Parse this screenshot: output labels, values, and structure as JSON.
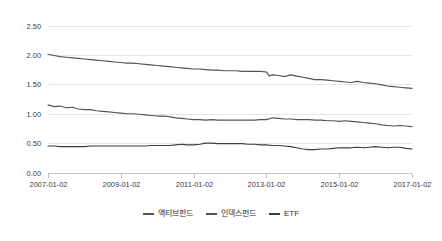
{
  "chart_data": {
    "type": "line",
    "title": "",
    "xlabel": "",
    "ylabel": "",
    "ylim": [
      0.0,
      2.5
    ],
    "ytick_labels": [
      "0.00",
      "0.50",
      "1.00",
      "1.50",
      "2.00",
      "2.50"
    ],
    "ytick_values": [
      0.0,
      0.5,
      1.0,
      1.5,
      2.0,
      2.5
    ],
    "xtick_labels": [
      "2007-01-02",
      "2009-01-02",
      "2011-01-02",
      "2013-01-02",
      "2015-01-02",
      "2017-01-02"
    ],
    "xtick_values": [
      2007.0,
      2009.0,
      2011.0,
      2013.0,
      2015.0,
      2017.0
    ],
    "xlim": [
      2007.0,
      2017.0
    ],
    "grid": "horizontal",
    "legend_position": "bottom-center",
    "series": [
      {
        "name": "액티브펀드",
        "color": "#545454",
        "x": [
          2007.0,
          2007.17,
          2007.33,
          2007.5,
          2007.67,
          2007.83,
          2008.0,
          2008.17,
          2008.33,
          2008.5,
          2008.67,
          2008.83,
          2009.0,
          2009.17,
          2009.33,
          2009.5,
          2009.67,
          2009.83,
          2010.0,
          2010.17,
          2010.33,
          2010.5,
          2010.67,
          2010.83,
          2011.0,
          2011.17,
          2011.33,
          2011.5,
          2011.67,
          2011.83,
          2012.0,
          2012.17,
          2012.33,
          2012.5,
          2012.67,
          2012.83,
          2013.0,
          2013.08,
          2013.17,
          2013.33,
          2013.5,
          2013.67,
          2013.83,
          2014.0,
          2014.17,
          2014.33,
          2014.5,
          2014.67,
          2014.83,
          2015.0,
          2015.17,
          2015.33,
          2015.5,
          2015.67,
          2015.83,
          2016.0,
          2016.17,
          2016.33,
          2016.5,
          2016.67,
          2016.83,
          2017.0
        ],
        "values": [
          2.01,
          1.99,
          1.97,
          1.96,
          1.95,
          1.94,
          1.93,
          1.92,
          1.91,
          1.9,
          1.89,
          1.88,
          1.87,
          1.86,
          1.86,
          1.85,
          1.84,
          1.83,
          1.82,
          1.81,
          1.8,
          1.79,
          1.78,
          1.77,
          1.76,
          1.76,
          1.75,
          1.74,
          1.74,
          1.73,
          1.73,
          1.73,
          1.72,
          1.72,
          1.72,
          1.72,
          1.71,
          1.64,
          1.66,
          1.65,
          1.63,
          1.66,
          1.64,
          1.62,
          1.6,
          1.58,
          1.58,
          1.57,
          1.56,
          1.55,
          1.54,
          1.53,
          1.55,
          1.53,
          1.52,
          1.51,
          1.49,
          1.47,
          1.46,
          1.45,
          1.44,
          1.43
        ]
      },
      {
        "name": "인덱스펀드",
        "color": "#545454",
        "x": [
          2007.0,
          2007.17,
          2007.33,
          2007.5,
          2007.67,
          2007.83,
          2008.0,
          2008.17,
          2008.33,
          2008.5,
          2008.67,
          2008.83,
          2009.0,
          2009.17,
          2009.33,
          2009.5,
          2009.67,
          2009.83,
          2010.0,
          2010.17,
          2010.33,
          2010.5,
          2010.67,
          2010.83,
          2011.0,
          2011.17,
          2011.33,
          2011.5,
          2011.67,
          2011.83,
          2012.0,
          2012.17,
          2012.33,
          2012.5,
          2012.67,
          2012.83,
          2013.0,
          2013.17,
          2013.33,
          2013.5,
          2013.67,
          2013.83,
          2014.0,
          2014.17,
          2014.33,
          2014.5,
          2014.67,
          2014.83,
          2015.0,
          2015.17,
          2015.33,
          2015.5,
          2015.67,
          2015.83,
          2016.0,
          2016.17,
          2016.33,
          2016.5,
          2016.67,
          2016.83,
          2017.0
        ],
        "values": [
          1.15,
          1.12,
          1.13,
          1.1,
          1.11,
          1.08,
          1.07,
          1.07,
          1.05,
          1.04,
          1.03,
          1.02,
          1.01,
          1.0,
          1.0,
          0.99,
          0.98,
          0.97,
          0.96,
          0.96,
          0.95,
          0.93,
          0.92,
          0.91,
          0.9,
          0.9,
          0.89,
          0.9,
          0.89,
          0.89,
          0.89,
          0.89,
          0.89,
          0.89,
          0.89,
          0.9,
          0.9,
          0.93,
          0.92,
          0.91,
          0.91,
          0.9,
          0.9,
          0.9,
          0.89,
          0.89,
          0.88,
          0.88,
          0.87,
          0.88,
          0.87,
          0.86,
          0.85,
          0.84,
          0.83,
          0.81,
          0.8,
          0.79,
          0.8,
          0.79,
          0.78
        ]
      },
      {
        "name": "ETF",
        "color": "#3d3d3d",
        "x": [
          2007.0,
          2007.17,
          2007.33,
          2007.5,
          2007.67,
          2007.83,
          2008.0,
          2008.17,
          2008.33,
          2008.5,
          2008.67,
          2008.83,
          2009.0,
          2009.17,
          2009.33,
          2009.5,
          2009.67,
          2009.83,
          2010.0,
          2010.17,
          2010.33,
          2010.5,
          2010.67,
          2010.83,
          2011.0,
          2011.17,
          2011.33,
          2011.5,
          2011.67,
          2011.83,
          2012.0,
          2012.17,
          2012.33,
          2012.5,
          2012.67,
          2012.83,
          2013.0,
          2013.17,
          2013.33,
          2013.5,
          2013.67,
          2013.83,
          2014.0,
          2014.17,
          2014.33,
          2014.5,
          2014.67,
          2014.83,
          2015.0,
          2015.17,
          2015.33,
          2015.5,
          2015.67,
          2015.83,
          2016.0,
          2016.17,
          2016.33,
          2016.5,
          2016.67,
          2016.83,
          2017.0
        ],
        "values": [
          0.45,
          0.45,
          0.44,
          0.44,
          0.44,
          0.44,
          0.44,
          0.45,
          0.45,
          0.45,
          0.45,
          0.45,
          0.45,
          0.45,
          0.45,
          0.45,
          0.45,
          0.46,
          0.46,
          0.46,
          0.46,
          0.47,
          0.48,
          0.47,
          0.47,
          0.48,
          0.5,
          0.5,
          0.49,
          0.49,
          0.49,
          0.49,
          0.49,
          0.48,
          0.48,
          0.47,
          0.47,
          0.46,
          0.46,
          0.45,
          0.44,
          0.42,
          0.4,
          0.39,
          0.39,
          0.4,
          0.4,
          0.41,
          0.42,
          0.42,
          0.42,
          0.43,
          0.42,
          0.43,
          0.44,
          0.43,
          0.42,
          0.43,
          0.43,
          0.41,
          0.4
        ]
      }
    ]
  },
  "legend": {
    "items": [
      {
        "label": "액티브펀드",
        "color": "#545454"
      },
      {
        "label": "인덱스펀드",
        "color": "#545454"
      },
      {
        "label": "ETF",
        "color": "#3d3d3d"
      }
    ]
  }
}
